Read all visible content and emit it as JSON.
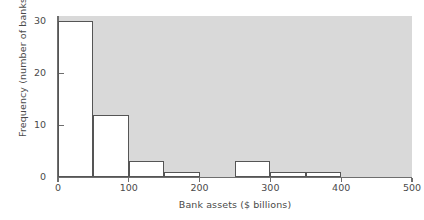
{
  "chart_data": {
    "type": "bar",
    "title": "",
    "subtitle": "",
    "xlabel": "Bank assets ($ billions)",
    "ylabel": "Frequency (number of banks)",
    "xlim": [
      0,
      500
    ],
    "ylim": [
      0,
      31
    ],
    "xticks": [
      0,
      100,
      200,
      300,
      400,
      500
    ],
    "yticks": [
      0,
      10,
      20,
      30
    ],
    "grid": false,
    "legend": null,
    "bin_width": 50,
    "bin_edges": [
      0,
      50,
      100,
      150,
      200,
      250,
      300,
      350,
      400,
      450,
      500
    ],
    "categories": [
      "0-50",
      "50-100",
      "100-150",
      "150-200",
      "200-250",
      "250-300",
      "300-350",
      "350-400",
      "400-450",
      "450-500"
    ],
    "values": [
      30,
      12,
      3,
      1,
      0,
      3,
      1,
      1,
      0,
      0
    ],
    "bars": [
      {
        "start": 0,
        "end": 50,
        "value": 30
      },
      {
        "start": 50,
        "end": 100,
        "value": 12
      },
      {
        "start": 100,
        "end": 150,
        "value": 3
      },
      {
        "start": 150,
        "end": 200,
        "value": 1
      },
      {
        "start": 200,
        "end": 250,
        "value": 0
      },
      {
        "start": 250,
        "end": 300,
        "value": 3
      },
      {
        "start": 300,
        "end": 350,
        "value": 1
      },
      {
        "start": 350,
        "end": 400,
        "value": 1
      },
      {
        "start": 400,
        "end": 450,
        "value": 0
      },
      {
        "start": 450,
        "end": 500,
        "value": 0
      }
    ],
    "colors": {
      "plot_background": "#d9d9d9",
      "bar_fill": "#ffffff",
      "bar_edge": "#555555",
      "axis": "#6e6e6e",
      "text": "#4a4a4a",
      "page_background": "#ffffff"
    }
  }
}
